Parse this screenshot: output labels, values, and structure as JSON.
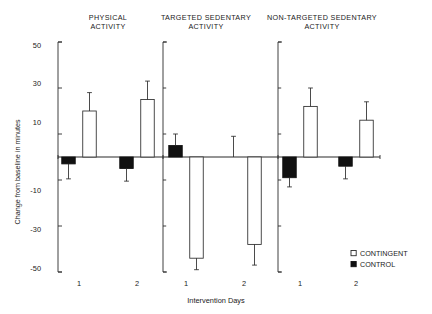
{
  "chart_data": {
    "type": "bar",
    "title": "",
    "xlabel": "Intervention Days",
    "ylabel": "Change from baseline in minutes",
    "ylim": [
      -50,
      50
    ],
    "yticks": [
      50,
      30,
      10,
      -10,
      -30,
      -50
    ],
    "ytick_labels": [
      "50",
      "30",
      "10",
      "-10",
      "-30",
      "-50"
    ],
    "grid": false,
    "legend_position": "right",
    "zero_reference_line": true,
    "panels": [
      {
        "id": "physical-activity",
        "title_line1": "PHYSICAL",
        "title_line2": "ACTIVITY",
        "categories": [
          "1",
          "2"
        ],
        "series": [
          {
            "name": "CONTROL",
            "style": "filled",
            "values": [
              -3,
              -5
            ],
            "error_upper": [
              -3,
              -5
            ],
            "error_lower": [
              -9.5,
              -10.5
            ]
          },
          {
            "name": "CONTINGENT",
            "style": "open",
            "values": [
              20,
              25
            ],
            "error_upper": [
              28,
              33
            ],
            "error_lower": [
              20,
              25
            ]
          }
        ]
      },
      {
        "id": "targeted-sedentary-activity",
        "title_line1": "TARGETED SEDENTARY",
        "title_line2": "ACTIVITY",
        "categories": [
          "1",
          "2"
        ],
        "series": [
          {
            "name": "CONTROL",
            "style": "filled",
            "values": [
              5,
              0
            ],
            "error_upper": [
              10,
              9
            ],
            "error_lower": [
              5,
              0
            ]
          },
          {
            "name": "CONTINGENT",
            "style": "open",
            "values": [
              -44,
              -38
            ],
            "error_upper": [
              -44,
              -38
            ],
            "error_lower": [
              -49,
              -47
            ]
          }
        ]
      },
      {
        "id": "non-targeted-sedentary-activity",
        "title_line1": "NON-TARGETED SEDENTARY",
        "title_line2": "ACTIVITY",
        "categories": [
          "1",
          "2"
        ],
        "series": [
          {
            "name": "CONTROL",
            "style": "filled",
            "values": [
              -9,
              -4
            ],
            "error_upper": [
              -9,
              -4
            ],
            "error_lower": [
              -13,
              -9.5
            ]
          },
          {
            "name": "CONTINGENT",
            "style": "open",
            "values": [
              22,
              16
            ],
            "error_upper": [
              30,
              24
            ],
            "error_lower": [
              22,
              16
            ]
          }
        ]
      }
    ],
    "legend": [
      {
        "label": "CONTINGENT",
        "style": "open"
      },
      {
        "label": "CONTROL",
        "style": "filled"
      }
    ]
  },
  "axes": {
    "y_title": "Change from baseline in minutes",
    "x_title": "Intervention Days",
    "y_tick_0": "50",
    "y_tick_1": "30",
    "y_tick_2": "10",
    "y_tick_3": "-10",
    "y_tick_4": "-30",
    "y_tick_5": "-50",
    "x_tick_0": "1",
    "x_tick_1": "2",
    "x_tick_2": "1",
    "x_tick_3": "2",
    "x_tick_4": "1",
    "x_tick_5": "2"
  },
  "panel_titles": {
    "p0_l1": "PHYSICAL",
    "p0_l2": "ACTIVITY",
    "p1_l1": "TARGETED SEDENTARY",
    "p1_l2": "ACTIVITY",
    "p2_l1": "NON-TARGETED SEDENTARY",
    "p2_l2": "ACTIVITY"
  },
  "legend": {
    "item0_label": "CONTINGENT",
    "item1_label": "CONTROL"
  },
  "colors": {
    "ink": "#1a1a1a",
    "axis": "#2b2b2b",
    "open_fill": "#ffffff",
    "filled_fill": "#111111",
    "background": "#ffffff"
  }
}
